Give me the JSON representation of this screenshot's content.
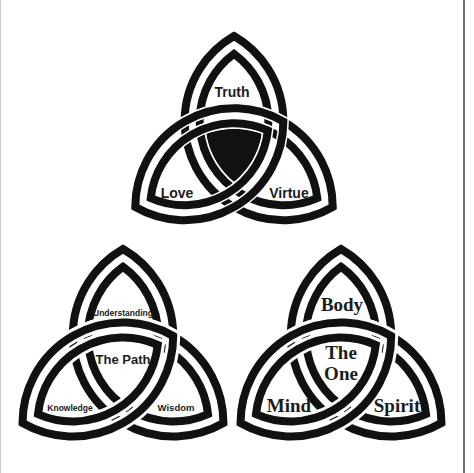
{
  "figures": [
    {
      "id": "top",
      "style": "filled-center",
      "labels": {
        "top": "Truth",
        "left": "Love",
        "right": "Virtue"
      }
    },
    {
      "id": "bottom-left",
      "style": "interlaced",
      "labels": {
        "top": "Understanding",
        "center": "The Path",
        "left": "Knowledge",
        "right": "Wisdom"
      }
    },
    {
      "id": "bottom-right",
      "style": "interlaced",
      "labels": {
        "top": "Body",
        "center_line1": "The",
        "center_line2": "One",
        "left": "Mind",
        "right": "Spirit"
      }
    }
  ],
  "colors": {
    "ink": "#111111",
    "paper": "#ffffff",
    "border": "#6e6e6e"
  }
}
